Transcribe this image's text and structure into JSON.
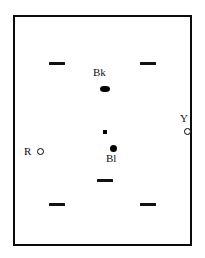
{
  "diagram": {
    "background_color": "#ffffff",
    "frame": {
      "name": "field-boundary",
      "border_color": "#0a0a0a",
      "fill_color": "#ffffff",
      "border_width_px": 2.5,
      "x": 13,
      "y": 15,
      "width": 179,
      "height": 231
    },
    "labels": {
      "bk": "Bk",
      "bl": "Bl",
      "r": "R",
      "y": "Y"
    },
    "markers": [
      {
        "id": "dash-top-left",
        "kind": "dash",
        "label": "",
        "color": "#111111",
        "x": 49,
        "y": 62,
        "width": 16,
        "height": 3
      },
      {
        "id": "dash-top-right",
        "kind": "dash",
        "label": "",
        "color": "#111111",
        "x": 140,
        "y": 62,
        "width": 16,
        "height": 3
      },
      {
        "id": "marker-bk",
        "kind": "diamond",
        "label": "Bk",
        "color": "#000000",
        "x": 100,
        "y": 86,
        "width": 10,
        "height": 6
      },
      {
        "id": "marker-y",
        "kind": "ring",
        "label": "Y",
        "color": "#000000",
        "x": 184,
        "y": 128,
        "width": 7,
        "height": 7
      },
      {
        "id": "dot-center-small",
        "kind": "small-square",
        "label": "",
        "color": "#000000",
        "x": 103,
        "y": 130,
        "width": 4,
        "height": 4
      },
      {
        "id": "marker-bl",
        "kind": "filled-circle",
        "label": "Bl",
        "color": "#000000",
        "x": 110,
        "y": 145,
        "width": 7,
        "height": 7
      },
      {
        "id": "marker-r",
        "kind": "ring",
        "label": "R",
        "color": "#000000",
        "x": 37,
        "y": 148,
        "width": 7,
        "height": 7
      },
      {
        "id": "dash-mid-center",
        "kind": "dash",
        "label": "",
        "color": "#111111",
        "x": 97,
        "y": 179,
        "width": 16,
        "height": 3
      },
      {
        "id": "dash-bottom-left",
        "kind": "dash",
        "label": "",
        "color": "#111111",
        "x": 49,
        "y": 203,
        "width": 16,
        "height": 3
      },
      {
        "id": "dash-bottom-right",
        "kind": "dash",
        "label": "",
        "color": "#111111",
        "x": 140,
        "y": 203,
        "width": 16,
        "height": 3
      }
    ],
    "label_positions": {
      "bk": {
        "x": 93,
        "y": 67
      },
      "bl": {
        "x": 106,
        "y": 153
      },
      "r": {
        "x": 24,
        "y": 146
      },
      "y": {
        "x": 180,
        "y": 113
      }
    }
  }
}
